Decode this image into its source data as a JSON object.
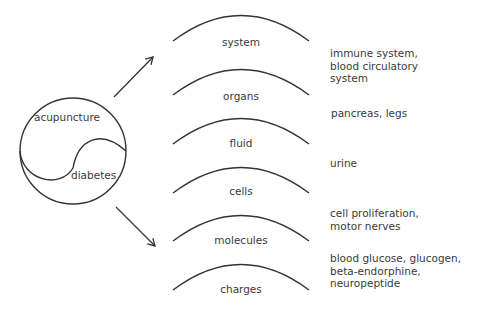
{
  "center": {
    "top_label": "acupuncture",
    "bottom_label": "diabetes"
  },
  "levels": [
    {
      "label": "system",
      "examples": "immune system,\nblood circulatory\nsystem"
    },
    {
      "label": "organs",
      "examples": "pancreas, legs"
    },
    {
      "label": "fluid",
      "examples": "urine"
    },
    {
      "label": "cells",
      "examples": "cell proliferation,\nmotor nerves"
    },
    {
      "label": "molecules",
      "examples": "blood glucose, glucogen,\nbeta-endorphine,\nneuropeptide"
    },
    {
      "label": "charges",
      "examples": ""
    }
  ],
  "colors": {
    "stroke": "#333333",
    "text": "#3a3a3a"
  }
}
